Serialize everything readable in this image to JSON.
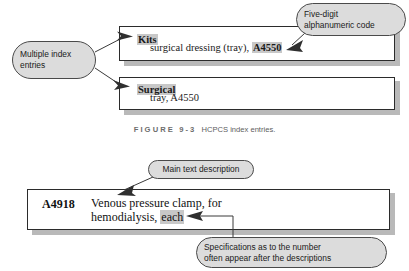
{
  "figure": {
    "caption_label": "FIGURE 9-3",
    "caption_text": "HCPCS index entries."
  },
  "colors": {
    "box_border": "#2b2b2b",
    "box_shadow": "#b9b9b9",
    "callout_fill": "#dcdcdc",
    "callout_border": "#4a4a4a",
    "highlight": "#c8c8c8",
    "caption_text": "#5d5d5d"
  },
  "index_entries": [
    {
      "term": "Kits",
      "subentry_prefix": "surgical dressing (tray), ",
      "subentry_code": "A4550"
    },
    {
      "term": "Surgical",
      "subentry_prefix": "tray, A4550",
      "subentry_code": ""
    }
  ],
  "code_entry": {
    "code": "A4918",
    "description_line1": "Venous pressure clamp, for",
    "description_line2_prefix": "hemodialysis, ",
    "description_line2_highlight": "each"
  },
  "callouts": {
    "multiple_index_entries": {
      "line1": "Multiple index",
      "line2": "entries"
    },
    "five_digit_code": {
      "line1": "Five-digit",
      "line2": "alphanumeric code"
    },
    "main_text_description": {
      "line1": "Main text description"
    },
    "specifications": {
      "line1": "Specifications as to the number",
      "line2": "often appear after the descriptions"
    }
  }
}
